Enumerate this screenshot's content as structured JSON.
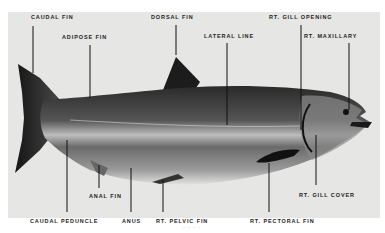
{
  "figure": {
    "background_color": "#e6e6e4",
    "labels": [
      {
        "id": "caudal-fin",
        "text": "CAUDAL FIN",
        "x": 31,
        "y": 14,
        "line": [
          33,
          26,
          33,
          73
        ]
      },
      {
        "id": "adipose-fin",
        "text": "ADIPOSE FIN",
        "x": 62,
        "y": 34,
        "line": [
          90,
          45,
          90,
          98
        ]
      },
      {
        "id": "dorsal-fin",
        "text": "DORSAL FIN",
        "x": 151,
        "y": 14,
        "line": [
          176,
          25,
          176,
          55
        ]
      },
      {
        "id": "lateral-line",
        "text": "LATERAL LINE",
        "x": 204,
        "y": 33,
        "line": [
          227,
          43,
          227,
          125
        ]
      },
      {
        "id": "rt-gill-opening",
        "text": "RT. GILL OPENING",
        "x": 269,
        "y": 14,
        "line": [
          301,
          25,
          301,
          130
        ]
      },
      {
        "id": "rt-maxillary",
        "text": "RT. MAXILLARY",
        "x": 304,
        "y": 33,
        "line": [
          349,
          43,
          349,
          110
        ]
      },
      {
        "id": "anal-fin",
        "text": "ANAL FIN",
        "x": 89,
        "y": 193,
        "line": [
          99,
          165,
          99,
          188
        ]
      },
      {
        "id": "caudal-peduncle",
        "text": "CAUDAL PEDUNCLE",
        "x": 30,
        "y": 218,
        "line": [
          67,
          140,
          67,
          212
        ]
      },
      {
        "id": "anus",
        "text": "ANUS",
        "x": 122,
        "y": 218,
        "line": [
          131,
          168,
          131,
          212
        ]
      },
      {
        "id": "rt-pelvic-fin",
        "text": "RT. PELVIC FIN",
        "x": 156,
        "y": 218,
        "line": [
          163,
          180,
          163,
          212
        ]
      },
      {
        "id": "rt-pectoral-fin",
        "text": "RT. PECTORAL FIN",
        "x": 250,
        "y": 218,
        "line": [
          269,
          163,
          269,
          212
        ]
      },
      {
        "id": "rt-gill-cover",
        "text": "RT. GILL COVER",
        "x": 299,
        "y": 192,
        "line": [
          316,
          135,
          316,
          185
        ]
      }
    ],
    "page_mark": "- - - -"
  }
}
